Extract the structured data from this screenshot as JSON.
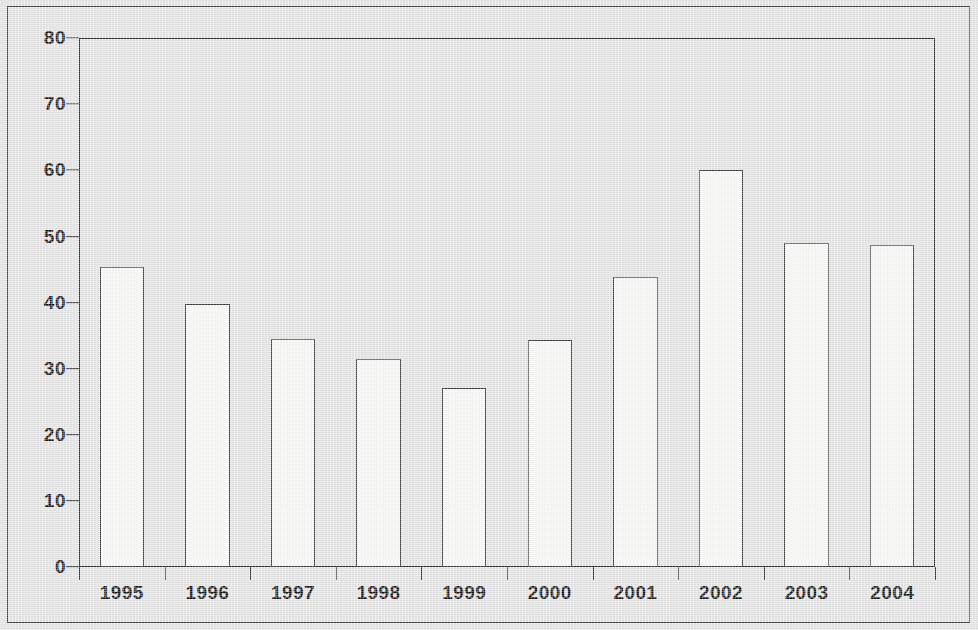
{
  "chart_data": {
    "type": "bar",
    "title": "",
    "subtitle": "",
    "xlabel": "",
    "ylabel": "",
    "categories": [
      "1995",
      "1996",
      "1997",
      "1998",
      "1999",
      "2000",
      "2001",
      "2002",
      "2003",
      "2004"
    ],
    "values": [
      45.4,
      39.7,
      34.5,
      31.5,
      27.0,
      34.3,
      43.8,
      60.0,
      49.0,
      48.7
    ],
    "ylim": [
      0,
      80
    ],
    "yticks": [
      0,
      10,
      20,
      30,
      40,
      50,
      60,
      70,
      80
    ],
    "ytick_labels": [
      "0",
      "10",
      "20",
      "30",
      "40",
      "50",
      "60",
      "70",
      "80"
    ],
    "grid": false,
    "legend": null,
    "legend_position": "none",
    "annotations": [],
    "bar_fill_color": "#f7f7f5",
    "bar_edge_color": "#3b3b3b",
    "axis_color": "#2b2b2b",
    "background_color": "#e3e3e3",
    "text_color": "#131313"
  },
  "figure": {
    "frame_border_color": "#3a3a3a"
  }
}
